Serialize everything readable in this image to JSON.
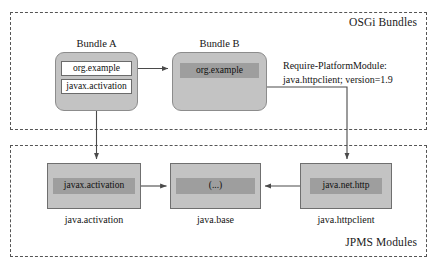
{
  "regions": {
    "osgi": {
      "label": "OSGi Bundles"
    },
    "jpms": {
      "label": "JPMS Modules"
    }
  },
  "bundles": [
    {
      "title": "Bundle A",
      "packages": [
        {
          "label": "org.example",
          "style": "white"
        },
        {
          "label": "javax.activation",
          "style": "white"
        }
      ]
    },
    {
      "title": "Bundle B",
      "packages": [
        {
          "label": "org.example",
          "style": "dark"
        }
      ]
    }
  ],
  "modules": [
    {
      "caption": "java.activation",
      "package": "javax.activation"
    },
    {
      "caption": "java.base",
      "package": "(...)"
    },
    {
      "caption": "java.httpclient",
      "package": "java.net.http"
    }
  ],
  "annotation": {
    "line1": "Require-PlatformModule:",
    "line2": "java.httpclient; version=1.9"
  },
  "colors": {
    "container_fill": "#c3c3c3",
    "inner_package_fill": "#9e9e9e",
    "white_package_fill": "#ffffff",
    "border": "#6f6f6f",
    "dashed_border": "#555555",
    "arrow": "#4a4a4a",
    "text": "#141414",
    "background": "#ffffff"
  },
  "connections": [
    {
      "name": "bundle-a-org-example-to-bundle-b",
      "from": "Bundle A / org.example",
      "to": "Bundle B"
    },
    {
      "name": "bundle-a-javax-activation-to-java-activation",
      "from": "Bundle A / javax.activation",
      "to": "java.activation"
    },
    {
      "name": "bundle-b-to-java-httpclient",
      "from": "Bundle B",
      "to": "java.httpclient"
    },
    {
      "name": "java-activation-to-java-base",
      "from": "java.activation",
      "to": "java.base"
    },
    {
      "name": "java-httpclient-to-java-base",
      "from": "java.httpclient",
      "to": "java.base"
    }
  ]
}
